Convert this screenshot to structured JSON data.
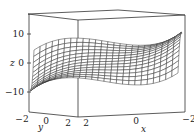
{
  "chart_data": {
    "type": "surface3d",
    "title": "",
    "xlabel": "x",
    "ylabel": "y",
    "zlabel": "z",
    "x_ticks": [
      "2",
      "0",
      "−2"
    ],
    "y_ticks": [
      "−2",
      "0",
      "2"
    ],
    "z_ticks": [
      "10",
      "0",
      "−10"
    ],
    "xlim": [
      -2,
      2
    ],
    "ylim": [
      -2,
      2
    ],
    "zlim": [
      -15,
      15
    ],
    "surface": "saddle-like cubic surface, wireframe mesh, z roughly between -15 and 15",
    "grid": false,
    "legend": null
  }
}
